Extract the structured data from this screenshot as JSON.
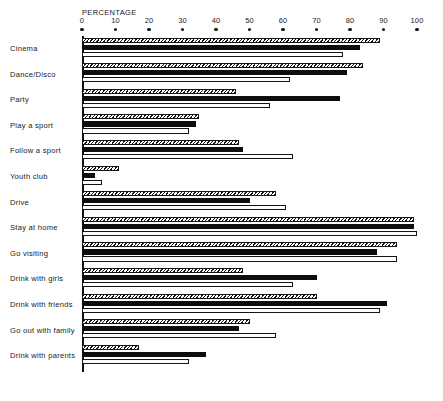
{
  "chart_data": {
    "type": "bar",
    "orientation": "horizontal",
    "title": "",
    "xlabel": "PERCENTAGE",
    "ylabel": "",
    "xlim": [
      0,
      100
    ],
    "xticks": [
      0,
      10,
      20,
      30,
      40,
      50,
      60,
      70,
      80,
      90,
      100
    ],
    "xtick_labels": [
      "0",
      "10",
      "20",
      "30",
      "40",
      "50",
      "60",
      "70",
      "80",
      "90",
      "100"
    ],
    "grid": false,
    "legend": "none",
    "categories": [
      "Cinema",
      "Dance/Disco",
      "Party",
      "Play a sport",
      "Follow a sport",
      "Youth club",
      "Drive",
      "Stay at home",
      "Go visiting",
      "Drink with girls",
      "Drink with friends",
      "Go out with family",
      "Drink with parents"
    ],
    "series": [
      {
        "name": "series-1",
        "style": "hatched",
        "values": [
          89,
          84,
          46,
          35,
          47,
          11,
          58,
          99,
          94,
          48,
          70,
          50,
          17
        ]
      },
      {
        "name": "series-2",
        "style": "solid-black",
        "values": [
          83,
          79,
          77,
          34,
          48,
          4,
          50,
          99,
          88,
          70,
          91,
          47,
          37
        ]
      },
      {
        "name": "series-3",
        "style": "open-white",
        "values": [
          78,
          62,
          56,
          32,
          63,
          6,
          61,
          100,
          94,
          63,
          89,
          58,
          32
        ]
      }
    ]
  }
}
